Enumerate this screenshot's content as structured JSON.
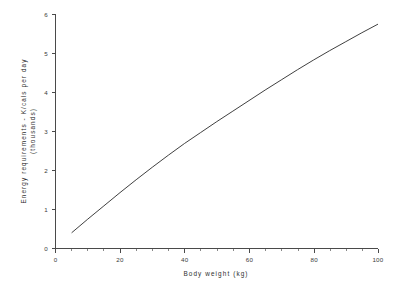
{
  "chart_data": {
    "type": "line",
    "title": "",
    "xlabel": "Body weight (kg)",
    "ylabel": "Energy requirements - K/cals per day (thousands)",
    "xlim": [
      0,
      100
    ],
    "ylim": [
      0,
      6
    ],
    "grid": false,
    "legend": null,
    "x_ticks": [
      0,
      20,
      40,
      60,
      80,
      100
    ],
    "x_tick_labels": [
      "0",
      "20",
      "40",
      "60",
      "80",
      "100"
    ],
    "x_minor_step": 5,
    "y_ticks": [
      0,
      1,
      2,
      3,
      4,
      5,
      6
    ],
    "y_tick_labels": [
      "0",
      "1",
      "2",
      "3",
      "4",
      "5",
      "6"
    ],
    "series": [
      {
        "name": "Energy requirement",
        "x": [
          5,
          10,
          15,
          20,
          25,
          30,
          35,
          40,
          45,
          50,
          55,
          60,
          65,
          70,
          75,
          80,
          85,
          90,
          95,
          100
        ],
        "values": [
          0.39,
          0.74,
          1.08,
          1.42,
          1.75,
          2.07,
          2.38,
          2.68,
          2.96,
          3.24,
          3.51,
          3.78,
          4.05,
          4.31,
          4.57,
          4.82,
          5.06,
          5.29,
          5.52,
          5.74
        ]
      }
    ]
  },
  "axes": {
    "x_title": "Body weight (kg)",
    "y_title_line1": "Energy requirements - K/cals per day",
    "y_title_line2": "(thousands)"
  }
}
